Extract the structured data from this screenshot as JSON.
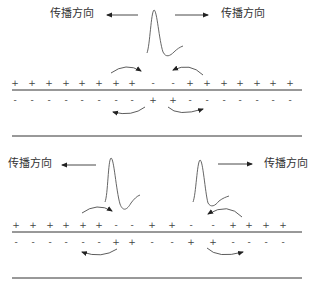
{
  "panels": [
    {
      "id": "top",
      "labels": [
        {
          "text": "传播方向",
          "x": 50,
          "y": 8
        },
        {
          "text": "传播方向",
          "x": 221,
          "y": 8
        }
      ],
      "outer_row": {
        "y": 79,
        "charges": [
          {
            "x": 15,
            "s": "+"
          },
          {
            "x": 32,
            "s": "+"
          },
          {
            "x": 49,
            "s": "+"
          },
          {
            "x": 66,
            "s": "+"
          },
          {
            "x": 82,
            "s": "+"
          },
          {
            "x": 99,
            "s": "+"
          },
          {
            "x": 116,
            "s": "+"
          },
          {
            "x": 132,
            "s": "+"
          },
          {
            "x": 153,
            "s": "-"
          },
          {
            "x": 173,
            "s": "-"
          },
          {
            "x": 190,
            "s": "+"
          },
          {
            "x": 207,
            "s": "+"
          },
          {
            "x": 224,
            "s": "+"
          },
          {
            "x": 240,
            "s": "+"
          },
          {
            "x": 257,
            "s": "+"
          },
          {
            "x": 273,
            "s": "+"
          },
          {
            "x": 290,
            "s": "+"
          }
        ]
      },
      "inner_row": {
        "y": 96,
        "charges": [
          {
            "x": 15,
            "s": "-"
          },
          {
            "x": 32,
            "s": "-"
          },
          {
            "x": 49,
            "s": "-"
          },
          {
            "x": 66,
            "s": "-"
          },
          {
            "x": 82,
            "s": "-"
          },
          {
            "x": 99,
            "s": "-"
          },
          {
            "x": 116,
            "s": "-"
          },
          {
            "x": 132,
            "s": "-"
          },
          {
            "x": 153,
            "s": "+"
          },
          {
            "x": 173,
            "s": "+"
          },
          {
            "x": 190,
            "s": "-"
          },
          {
            "x": 207,
            "s": "-"
          },
          {
            "x": 224,
            "s": "-"
          },
          {
            "x": 240,
            "s": "-"
          },
          {
            "x": 257,
            "s": "-"
          },
          {
            "x": 273,
            "s": "-"
          },
          {
            "x": 290,
            "s": "-"
          }
        ]
      }
    },
    {
      "id": "bottom",
      "labels": [
        {
          "text": "传播方向",
          "x": 8,
          "y": 158
        },
        {
          "text": "传播方向",
          "x": 264,
          "y": 158
        }
      ],
      "outer_row": {
        "y": 221,
        "charges": [
          {
            "x": 16,
            "s": "+"
          },
          {
            "x": 33,
            "s": "+"
          },
          {
            "x": 50,
            "s": "+"
          },
          {
            "x": 66,
            "s": "+"
          },
          {
            "x": 83,
            "s": "+"
          },
          {
            "x": 99,
            "s": "+"
          },
          {
            "x": 116,
            "s": "-"
          },
          {
            "x": 132,
            "s": "-"
          },
          {
            "x": 152,
            "s": "+"
          },
          {
            "x": 172,
            "s": "+"
          },
          {
            "x": 191,
            "s": "-"
          },
          {
            "x": 213,
            "s": "-"
          },
          {
            "x": 233,
            "s": "+"
          },
          {
            "x": 249,
            "s": "+"
          },
          {
            "x": 266,
            "s": "+"
          },
          {
            "x": 283,
            "s": "+"
          }
        ]
      },
      "inner_row": {
        "y": 238,
        "charges": [
          {
            "x": 16,
            "s": "-"
          },
          {
            "x": 33,
            "s": "-"
          },
          {
            "x": 50,
            "s": "-"
          },
          {
            "x": 66,
            "s": "-"
          },
          {
            "x": 83,
            "s": "-"
          },
          {
            "x": 99,
            "s": "-"
          },
          {
            "x": 116,
            "s": "+"
          },
          {
            "x": 132,
            "s": "+"
          },
          {
            "x": 152,
            "s": "-"
          },
          {
            "x": 172,
            "s": "-"
          },
          {
            "x": 191,
            "s": "+"
          },
          {
            "x": 213,
            "s": "+"
          },
          {
            "x": 233,
            "s": "-"
          },
          {
            "x": 249,
            "s": "-"
          },
          {
            "x": 266,
            "s": "-"
          },
          {
            "x": 283,
            "s": "-"
          }
        ]
      }
    }
  ]
}
